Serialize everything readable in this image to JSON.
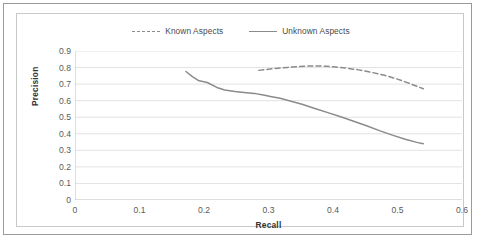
{
  "chart_data": {
    "type": "line",
    "title": "",
    "xlabel": "Recall",
    "ylabel": "Precision",
    "xlim": [
      0,
      0.6
    ],
    "ylim": [
      0,
      0.9
    ],
    "xticks": [
      "0",
      "0.1",
      "0.2",
      "0.3",
      "0.4",
      "0.5",
      "0.6"
    ],
    "xtick_values": [
      0,
      0.1,
      0.2,
      0.3,
      0.4,
      0.5,
      0.6
    ],
    "yticks": [
      "0",
      "0.1",
      "0.2",
      "0.3",
      "0.4",
      "0.5",
      "0.6",
      "0.7",
      "0.8",
      "0.9"
    ],
    "ytick_values": [
      0,
      0.1,
      0.2,
      0.3,
      0.4,
      0.5,
      0.6,
      0.7,
      0.8,
      0.9
    ],
    "grid": "horizontal",
    "legend_position": "top-center",
    "series": [
      {
        "name": "Known Aspects",
        "style": "dashed",
        "color": "#8b8b8b",
        "points": [
          [
            0.285,
            0.783
          ],
          [
            0.3,
            0.79
          ],
          [
            0.315,
            0.796
          ],
          [
            0.33,
            0.801
          ],
          [
            0.345,
            0.806
          ],
          [
            0.36,
            0.809
          ],
          [
            0.375,
            0.81
          ],
          [
            0.39,
            0.808
          ],
          [
            0.405,
            0.803
          ],
          [
            0.42,
            0.797
          ],
          [
            0.44,
            0.786
          ],
          [
            0.46,
            0.771
          ],
          [
            0.48,
            0.753
          ],
          [
            0.5,
            0.73
          ],
          [
            0.52,
            0.702
          ],
          [
            0.54,
            0.672
          ]
        ]
      },
      {
        "name": "Unknown Aspects",
        "style": "solid",
        "color": "#8b8b8b",
        "points": [
          [
            0.172,
            0.776
          ],
          [
            0.182,
            0.745
          ],
          [
            0.191,
            0.722
          ],
          [
            0.205,
            0.71
          ],
          [
            0.22,
            0.68
          ],
          [
            0.232,
            0.664
          ],
          [
            0.248,
            0.655
          ],
          [
            0.262,
            0.65
          ],
          [
            0.278,
            0.644
          ],
          [
            0.292,
            0.634
          ],
          [
            0.305,
            0.624
          ],
          [
            0.318,
            0.614
          ],
          [
            0.332,
            0.6
          ],
          [
            0.352,
            0.578
          ],
          [
            0.372,
            0.553
          ],
          [
            0.392,
            0.528
          ],
          [
            0.412,
            0.503
          ],
          [
            0.432,
            0.476
          ],
          [
            0.452,
            0.448
          ],
          [
            0.472,
            0.419
          ],
          [
            0.492,
            0.392
          ],
          [
            0.512,
            0.367
          ],
          [
            0.53,
            0.348
          ],
          [
            0.54,
            0.34
          ]
        ]
      }
    ]
  },
  "legend": {
    "entries": [
      {
        "label": "Known Aspects"
      },
      {
        "label": "Unknown Aspects"
      }
    ]
  },
  "colors": {
    "series_line": "#8b8b8b",
    "gridline": "#e2e2e2",
    "axis": "#bdbdbd",
    "outer_border": "#9a9a9a",
    "inner_border": "#c9c9c9",
    "tick_text": "#5a5a5a",
    "axis_title_text": "#333333"
  }
}
